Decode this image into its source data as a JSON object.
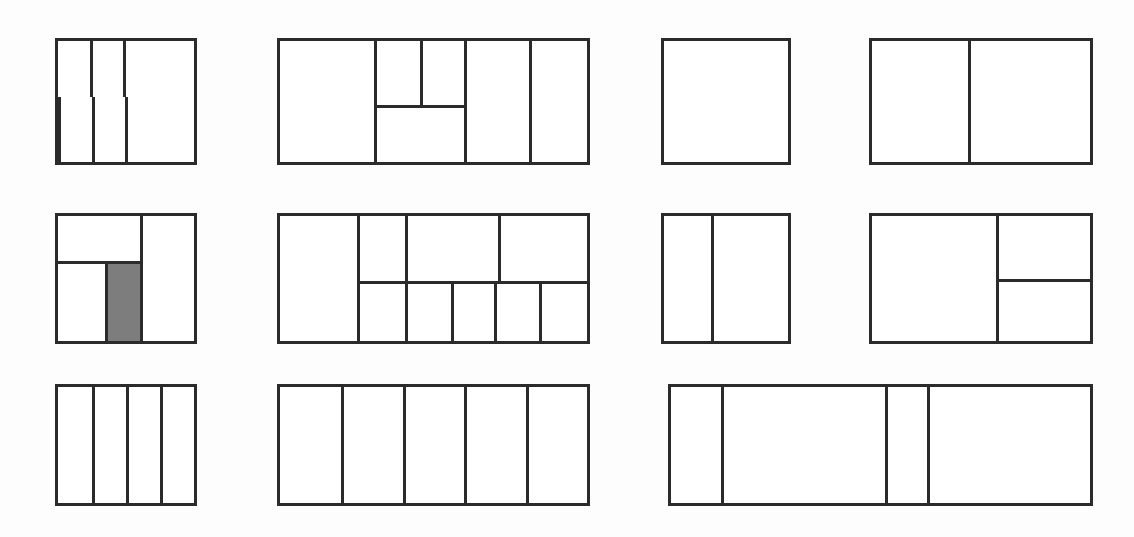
{
  "canvas": {
    "width": 1134,
    "height": 537,
    "background_color": "#fdfdfd",
    "line_color": "#2b2b2b",
    "fill_color": "#ffffff",
    "shaded_color": "#7d7d7d",
    "stroke_width_px": 3
  },
  "figure": {
    "type": "layout-partition-diagrams",
    "rows": 3,
    "panel_count": 11
  },
  "panels": [
    {
      "id": "panel-r1c1",
      "row": 1,
      "column": 1,
      "x": 55,
      "y": 38,
      "width": 142,
      "height": 127,
      "split": "rows",
      "row_fractions": [
        0.46,
        0.54
      ],
      "cells_per_row": [
        3,
        3
      ],
      "column_fractions": [
        [
          0.235,
          0.245,
          0.52
        ],
        [
          0.235,
          0.245,
          0.52
        ]
      ],
      "shaded_cells": [],
      "cell_count": 6
    },
    {
      "id": "panel-r1c2",
      "row": 1,
      "column": 2,
      "x": 277,
      "y": 38,
      "width": 313,
      "height": 127,
      "split": "columns",
      "column_fractions": [
        0.305,
        0.295,
        0.21,
        0.19
      ],
      "nested": {
        "index": 1,
        "split": "rows",
        "row_fractions": [
          0.53,
          0.47
        ],
        "top_columns": [
          0.5,
          0.5
        ]
      },
      "shaded_cells": [],
      "cell_count": 6
    },
    {
      "id": "panel-r1c3",
      "row": 1,
      "column": 3,
      "x": 661,
      "y": 38,
      "width": 130,
      "height": 127,
      "split": "none",
      "column_fractions": [
        1.0
      ],
      "shaded_cells": [],
      "cell_count": 1
    },
    {
      "id": "panel-r1c4",
      "row": 1,
      "column": 4,
      "x": 869,
      "y": 38,
      "width": 224,
      "height": 127,
      "split": "columns",
      "column_fractions": [
        0.44,
        0.56
      ],
      "shaded_cells": [],
      "cell_count": 2
    },
    {
      "id": "panel-r2c1",
      "row": 2,
      "column": 1,
      "x": 55,
      "y": 213,
      "width": 142,
      "height": 131,
      "split": "columns",
      "column_fractions": [
        0.6,
        0.4
      ],
      "nested": {
        "index": 0,
        "split": "rows",
        "row_fractions": [
          0.36,
          0.64
        ],
        "bottom_columns": [
          0.58,
          0.42
        ],
        "shaded_index": 1
      },
      "shaded_cells": [
        "left-bottom-right"
      ],
      "cell_count": 4
    },
    {
      "id": "panel-r2c2",
      "row": 2,
      "column": 2,
      "x": 277,
      "y": 213,
      "width": 313,
      "height": 131,
      "split": "columns",
      "column_fractions": [
        0.25,
        0.75
      ],
      "nested": {
        "index": 1,
        "split": "rows",
        "row_fractions": [
          0.52,
          0.48
        ],
        "top_columns": [
          0.2,
          0.41,
          0.39
        ],
        "bottom_columns": [
          0.2,
          0.2,
          0.19,
          0.2,
          0.21
        ]
      },
      "shaded_cells": [],
      "cell_count": 9
    },
    {
      "id": "panel-r2c3",
      "row": 2,
      "column": 3,
      "x": 661,
      "y": 213,
      "width": 130,
      "height": 131,
      "split": "columns",
      "column_fractions": [
        0.38,
        0.62
      ],
      "shaded_cells": [],
      "cell_count": 2
    },
    {
      "id": "panel-r2c4",
      "row": 2,
      "column": 4,
      "x": 869,
      "y": 213,
      "width": 224,
      "height": 131,
      "split": "columns",
      "column_fractions": [
        0.57,
        0.43
      ],
      "nested": {
        "index": 1,
        "split": "rows",
        "row_fractions": [
          0.5,
          0.5
        ]
      },
      "shaded_cells": [],
      "cell_count": 3
    },
    {
      "id": "panel-r3c1",
      "row": 3,
      "column": 1,
      "x": 55,
      "y": 384,
      "width": 142,
      "height": 122,
      "split": "columns",
      "column_fractions": [
        0.25,
        0.25,
        0.25,
        0.25
      ],
      "shaded_cells": [],
      "cell_count": 4
    },
    {
      "id": "panel-r3c2",
      "row": 3,
      "column": 2,
      "x": 277,
      "y": 384,
      "width": 313,
      "height": 122,
      "split": "columns",
      "column_fractions": [
        0.2,
        0.2,
        0.2,
        0.2,
        0.2
      ],
      "shaded_cells": [],
      "cell_count": 5
    },
    {
      "id": "panel-r3c3",
      "row": 3,
      "column": 3,
      "x": 668,
      "y": 384,
      "width": 425,
      "height": 122,
      "split": "columns",
      "column_fractions": [
        0.12,
        0.39,
        0.1,
        0.39
      ],
      "shaded_cells": [],
      "cell_count": 4
    }
  ]
}
